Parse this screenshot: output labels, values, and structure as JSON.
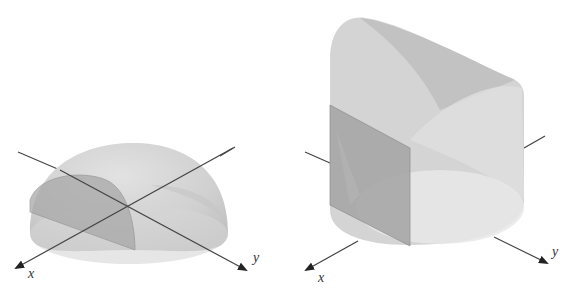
{
  "figures": [
    {
      "id": "hemisphere",
      "description": "Solid hemisphere with a quarter cross-section region shaded, over xy-plane",
      "axes": {
        "x_label": "x",
        "y_label": "y"
      }
    },
    {
      "id": "cylinder-wedge",
      "description": "Cylinder cut by a slanted parabolic top with rectangular cross-section shaded",
      "axes": {
        "x_label": "x",
        "y_label": "y"
      }
    }
  ],
  "colors": {
    "surface_light": "#dcdcdc",
    "surface_mid": "#c8c8c8",
    "surface_dark": "#b0b0b0",
    "cross_section": "#9e9e9e",
    "base_ellipse": "#e6e6e6",
    "axis_line": "#444444"
  }
}
